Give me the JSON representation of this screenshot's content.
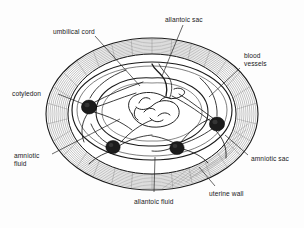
{
  "figure": {
    "type": "anatomical-diagram",
    "background_color": "#fdfdfd",
    "line_color": "#1a1a1a",
    "shade_color": "#8c8c8c",
    "node_color": "#1c1c1c"
  },
  "labels": {
    "umbilical_cord": "umbilical cord",
    "allantoic_sac": "allantoic sac",
    "blood_vessels_line1": "blood",
    "blood_vessels_line2": "vessels",
    "cotyledon": "cotyledon",
    "amniotic_fluid_line1": "amniotic",
    "amniotic_fluid_line2": "fluid",
    "amniotic_sac": "amniotic sac",
    "allantoic_fluid": "allantoic fluid",
    "uterine_wall": "uterine wall"
  },
  "structures": [
    {
      "name": "uterine-wall",
      "description": "outer hatched elliptical wall"
    },
    {
      "name": "allantoic-sac",
      "description": "outer membrane ring"
    },
    {
      "name": "amniotic-sac",
      "description": "inner membrane ring"
    },
    {
      "name": "allantoic-fluid",
      "description": "space between membranes"
    },
    {
      "name": "amniotic-fluid",
      "description": "inner fluid space"
    },
    {
      "name": "fetus",
      "description": "central curled fetus"
    },
    {
      "name": "cotyledon",
      "count": 4,
      "description": "dark placental attachment nodes"
    },
    {
      "name": "umbilical-cord",
      "description": "cord from fetus"
    },
    {
      "name": "blood-vessels",
      "description": "vessels radiating from cotyledons"
    }
  ]
}
